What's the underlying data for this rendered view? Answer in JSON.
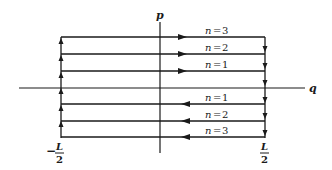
{
  "diagram": {
    "type": "phase-space-trajectories",
    "axes": {
      "horizontal": {
        "label": "q"
      },
      "vertical": {
        "label": "p"
      }
    },
    "bounds": {
      "left": {
        "sign": "−",
        "numerator": "L",
        "denominator": "2"
      },
      "right": {
        "numerator": "L",
        "denominator": "2"
      }
    },
    "upper_trajectories": [
      {
        "label": "n = 3",
        "n": "n",
        "eq": "=",
        "value": "3",
        "direction": "right"
      },
      {
        "label": "n = 2",
        "n": "n",
        "eq": "=",
        "value": "2",
        "direction": "right"
      },
      {
        "label": "n = 1",
        "n": "n",
        "eq": "=",
        "value": "1",
        "direction": "right"
      }
    ],
    "lower_trajectories": [
      {
        "label": "n = 1",
        "n": "n",
        "eq": "=",
        "value": "1",
        "direction": "left"
      },
      {
        "label": "n = 2",
        "n": "n",
        "eq": "=",
        "value": "2",
        "direction": "left"
      },
      {
        "label": "n = 3",
        "n": "n",
        "eq": "=",
        "value": "3",
        "direction": "left"
      }
    ],
    "colors": {
      "ink": "#1a1a1a",
      "background": "#ffffff"
    }
  }
}
